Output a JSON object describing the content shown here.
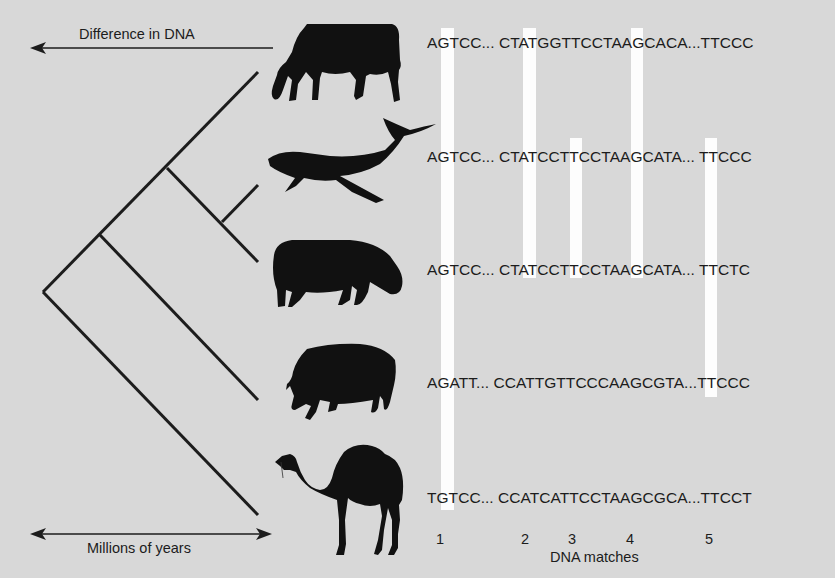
{
  "labels": {
    "difference_axis": "Difference in DNA",
    "time_axis": "Millions of years",
    "matches_axis": "DNA matches"
  },
  "animals": [
    {
      "name": "cow",
      "icon": "cow-icon",
      "sequence": "AGTCC... CTATGGTTCCTAAGCACA...TTCCC"
    },
    {
      "name": "whale",
      "icon": "whale-icon",
      "sequence": "AGTCC... CTATCCTTCCTAAGCATA... TTCCC"
    },
    {
      "name": "hippopotamus",
      "icon": "hippo-icon",
      "sequence": "AGTCC... CTATCCTTCCTAAGCATA... TTCTC"
    },
    {
      "name": "pig",
      "icon": "pig-icon",
      "sequence": "AGATT... CCATTGTTCCCAAGCGTA...TTCCC"
    },
    {
      "name": "camel",
      "icon": "camel-icon",
      "sequence": "TGTCC... CCATCATTCCTAAGCGCA...TTCCT"
    }
  ],
  "matches": [
    {
      "number": "1",
      "spans": [
        "cow",
        "whale",
        "hippopotamus",
        "pig",
        "camel"
      ]
    },
    {
      "number": "2",
      "spans": [
        "cow",
        "whale",
        "hippopotamus"
      ]
    },
    {
      "number": "3",
      "spans": [
        "whale",
        "hippopotamus"
      ]
    },
    {
      "number": "4",
      "spans": [
        "cow",
        "whale",
        "hippopotamus"
      ]
    },
    {
      "number": "5",
      "spans": [
        "whale",
        "hippopotamus",
        "pig"
      ]
    }
  ],
  "colors": {
    "background": "#d8d8d8",
    "match_bar": "#fdfdfd",
    "ink": "#1c1c1c"
  }
}
